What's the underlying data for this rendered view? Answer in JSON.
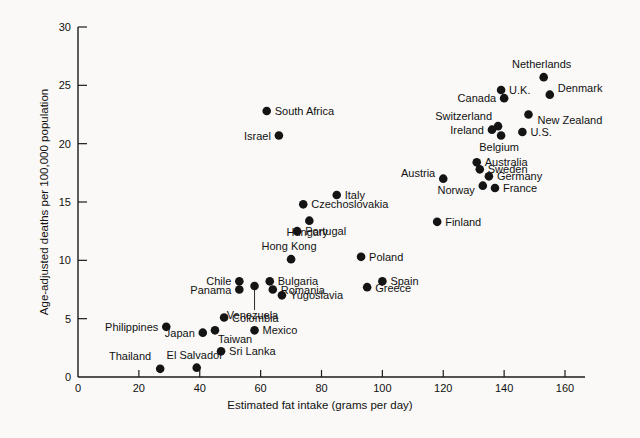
{
  "chart_data": {
    "type": "scatter",
    "title": "",
    "xlabel": "Estimated fat intake (grams per day)",
    "ylabel": "Age-adjusted deaths per 100,000 population",
    "xlim": [
      0,
      165
    ],
    "ylim": [
      0,
      30
    ],
    "xticks": [
      0,
      20,
      40,
      60,
      80,
      100,
      120,
      140,
      160
    ],
    "xtick_labels": [
      "0",
      "20",
      "40",
      "60",
      "80",
      "100",
      "120",
      "140",
      "160"
    ],
    "yticks": [
      0,
      5,
      10,
      15,
      20,
      25,
      30
    ],
    "ytick_labels": [
      "0",
      "5",
      "10",
      "15",
      "20",
      "25",
      "30"
    ],
    "grid": false,
    "legend": "none",
    "marker": "filled-circle",
    "marker_color": "#141414",
    "points": [
      {
        "label": "Thailand",
        "x": 27,
        "y": 0.7,
        "lx": -9,
        "ly": -9,
        "anchor": "end",
        "leader": false
      },
      {
        "label": "El Salvador",
        "x": 39,
        "y": 0.8,
        "lx": -2,
        "ly": -9,
        "anchor": "middle",
        "leader": false
      },
      {
        "label": "Sri Lanka",
        "x": 47,
        "y": 2.2,
        "lx": 8,
        "ly": 4,
        "anchor": "start",
        "leader": false
      },
      {
        "label": "Japan",
        "x": 41,
        "y": 3.8,
        "lx": -8,
        "ly": 4,
        "anchor": "end",
        "leader": false
      },
      {
        "label": "Taiwan",
        "x": 45,
        "y": 4.0,
        "lx": 3,
        "ly": 13,
        "anchor": "start",
        "leader": false
      },
      {
        "label": "Philippines",
        "x": 29,
        "y": 4.3,
        "lx": -8,
        "ly": 4,
        "anchor": "end",
        "leader": false
      },
      {
        "label": "Mexico",
        "x": 58,
        "y": 4.0,
        "lx": 8,
        "ly": 4,
        "anchor": "start",
        "leader": false
      },
      {
        "label": "Colombia",
        "x": 48,
        "y": 5.1,
        "lx": 8,
        "ly": 4,
        "anchor": "start",
        "leader": false
      },
      {
        "label": "Panama",
        "x": 53,
        "y": 7.5,
        "lx": -8,
        "ly": 4,
        "anchor": "end",
        "leader": false
      },
      {
        "label": "Chile",
        "x": 53,
        "y": 8.2,
        "lx": -8,
        "ly": 4,
        "anchor": "end",
        "leader": false
      },
      {
        "label": "Venezuela",
        "x": 58,
        "y": 7.8,
        "lx": -2,
        "ly": 33,
        "anchor": "middle",
        "leader": true
      },
      {
        "label": "Yugoslavia",
        "x": 67,
        "y": 7.0,
        "lx": 8,
        "ly": 4,
        "anchor": "start",
        "leader": false
      },
      {
        "label": "Romania",
        "x": 64,
        "y": 7.5,
        "lx": 8,
        "ly": 4,
        "anchor": "start",
        "leader": false
      },
      {
        "label": "Bulgaria",
        "x": 63,
        "y": 8.2,
        "lx": 8,
        "ly": 4,
        "anchor": "start",
        "leader": false
      },
      {
        "label": "Greece",
        "x": 95,
        "y": 7.7,
        "lx": 8,
        "ly": 5,
        "anchor": "start",
        "leader": false
      },
      {
        "label": "Spain",
        "x": 100,
        "y": 8.2,
        "lx": 8,
        "ly": 4,
        "anchor": "start",
        "leader": false
      },
      {
        "label": "Hong Kong",
        "x": 70,
        "y": 10.1,
        "lx": -2,
        "ly": -9,
        "anchor": "middle",
        "leader": false
      },
      {
        "label": "Poland",
        "x": 93,
        "y": 10.3,
        "lx": 8,
        "ly": 4,
        "anchor": "start",
        "leader": false
      },
      {
        "label": "Portugal",
        "x": 72,
        "y": 12.5,
        "lx": 8,
        "ly": 4,
        "anchor": "start",
        "leader": false
      },
      {
        "label": "Hungary",
        "x": 76,
        "y": 13.4,
        "lx": -2,
        "ly": 15,
        "anchor": "middle",
        "leader": false
      },
      {
        "label": "Finland",
        "x": 118,
        "y": 13.3,
        "lx": 8,
        "ly": 4,
        "anchor": "start",
        "leader": false
      },
      {
        "label": "Czechoslovakia",
        "x": 74,
        "y": 14.8,
        "lx": 8,
        "ly": 4,
        "anchor": "start",
        "leader": false
      },
      {
        "label": "Italy",
        "x": 85,
        "y": 15.6,
        "lx": 8,
        "ly": 4,
        "anchor": "start",
        "leader": false
      },
      {
        "label": "France",
        "x": 137,
        "y": 16.2,
        "lx": 8,
        "ly": 4,
        "anchor": "start",
        "leader": false
      },
      {
        "label": "Norway",
        "x": 133,
        "y": 16.4,
        "lx": -8,
        "ly": 8,
        "anchor": "end",
        "leader": false
      },
      {
        "label": "Germany",
        "x": 135,
        "y": 17.2,
        "lx": 8,
        "ly": 4,
        "anchor": "start",
        "leader": false
      },
      {
        "label": "Austria",
        "x": 120,
        "y": 17.0,
        "lx": -8,
        "ly": -2,
        "anchor": "end",
        "leader": false
      },
      {
        "label": "Sweden",
        "x": 132,
        "y": 17.8,
        "lx": 8,
        "ly": 4,
        "anchor": "start",
        "leader": false
      },
      {
        "label": "Australia",
        "x": 131,
        "y": 18.4,
        "lx": 8,
        "ly": 4,
        "anchor": "start",
        "leader": false
      },
      {
        "label": "Belgium",
        "x": 139,
        "y": 20.7,
        "lx": -2,
        "ly": 15,
        "anchor": "middle",
        "leader": false
      },
      {
        "label": "U.S.",
        "x": 146,
        "y": 21.0,
        "lx": 8,
        "ly": 4,
        "anchor": "start",
        "leader": false
      },
      {
        "label": "Ireland",
        "x": 136,
        "y": 21.2,
        "lx": -8,
        "ly": 4,
        "anchor": "end",
        "leader": false
      },
      {
        "label": "Switzerland",
        "x": 138,
        "y": 21.5,
        "lx": -6,
        "ly": -6,
        "anchor": "end",
        "leader": false
      },
      {
        "label": "Israel",
        "x": 66,
        "y": 20.7,
        "lx": -8,
        "ly": 4,
        "anchor": "end",
        "leader": false
      },
      {
        "label": "New Zealand",
        "x": 148,
        "y": 22.5,
        "lx": 9,
        "ly": 9,
        "anchor": "start",
        "leader": false
      },
      {
        "label": "South Africa",
        "x": 62,
        "y": 22.8,
        "lx": 8,
        "ly": 4,
        "anchor": "start",
        "leader": false
      },
      {
        "label": "Canada",
        "x": 140,
        "y": 23.9,
        "lx": -8,
        "ly": 4,
        "anchor": "end",
        "leader": false
      },
      {
        "label": "Denmark",
        "x": 155,
        "y": 24.2,
        "lx": 8,
        "ly": -3,
        "anchor": "start",
        "leader": false
      },
      {
        "label": "U.K.",
        "x": 139,
        "y": 24.6,
        "lx": 8,
        "ly": 4,
        "anchor": "start",
        "leader": false
      },
      {
        "label": "Netherlands",
        "x": 153,
        "y": 25.7,
        "lx": -2,
        "ly": -9,
        "anchor": "middle",
        "leader": false
      }
    ]
  }
}
